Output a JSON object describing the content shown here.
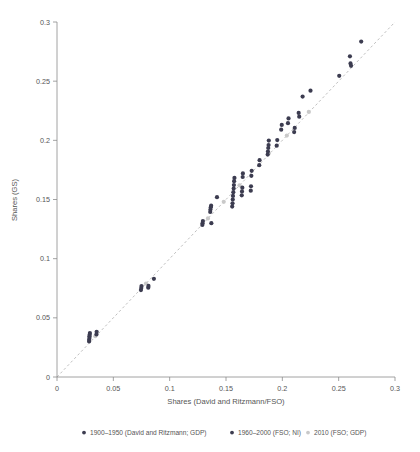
{
  "chart_data": {
    "type": "scatter",
    "title": "",
    "xlabel": "Shares (David and Ritzmann/FSO)",
    "ylabel": "Shares (GS)",
    "xlim": [
      0,
      0.3
    ],
    "ylim": [
      0,
      0.3
    ],
    "xticks": [
      "0",
      "0.05",
      "0.1",
      "0.15",
      "0.2",
      "0.25",
      "0.3"
    ],
    "xtick_values": [
      0,
      0.05,
      0.1,
      0.15,
      0.2,
      0.25,
      0.3
    ],
    "yticks": [
      "0",
      "0.05",
      "0.1",
      "0.15",
      "0.2",
      "0.25",
      "0.3"
    ],
    "ytick_values": [
      0,
      0.05,
      0.1,
      0.15,
      0.2,
      0.25,
      0.3
    ],
    "grid": false,
    "legend_position": "bottom",
    "reference_line": {
      "name": "45-degree identity line",
      "style": "dashed",
      "color": "#b8b8b8",
      "from": [
        0,
        0
      ],
      "to": [
        0.3,
        0.3
      ]
    },
    "series": [
      {
        "name": "1900–1950 (David and Ritzmann; GDP)",
        "color": "#3c3c50",
        "marker": "circle",
        "points": [
          [
            0.0285,
            0.03
          ],
          [
            0.0285,
            0.0315
          ],
          [
            0.0288,
            0.033
          ],
          [
            0.0288,
            0.0345
          ],
          [
            0.029,
            0.0358
          ],
          [
            0.0292,
            0.0372
          ],
          [
            0.035,
            0.036
          ],
          [
            0.0352,
            0.0382
          ],
          [
            0.0745,
            0.0735
          ],
          [
            0.0748,
            0.0752
          ],
          [
            0.075,
            0.0768
          ],
          [
            0.081,
            0.0755
          ],
          [
            0.0812,
            0.077
          ],
          [
            0.086,
            0.083
          ],
          [
            0.129,
            0.1285
          ],
          [
            0.1292,
            0.13
          ],
          [
            0.1295,
            0.1318
          ],
          [
            0.136,
            0.1395
          ],
          [
            0.1362,
            0.1415
          ],
          [
            0.1365,
            0.1435
          ],
          [
            0.1368,
            0.1448
          ],
          [
            0.137,
            0.13
          ],
          [
            0.142,
            0.152
          ]
        ]
      },
      {
        "name": "1960–2000 (FSO; NI)",
        "color": "#3c3c50",
        "marker": "circle",
        "points": [
          [
            0.1555,
            0.144
          ],
          [
            0.1558,
            0.1468
          ],
          [
            0.156,
            0.15
          ],
          [
            0.1562,
            0.153
          ],
          [
            0.1565,
            0.1562
          ],
          [
            0.1568,
            0.1592
          ],
          [
            0.157,
            0.1622
          ],
          [
            0.1572,
            0.1655
          ],
          [
            0.1575,
            0.1682
          ],
          [
            0.164,
            0.1535
          ],
          [
            0.1642,
            0.1568
          ],
          [
            0.1645,
            0.16
          ],
          [
            0.1648,
            0.169
          ],
          [
            0.165,
            0.172
          ],
          [
            0.172,
            0.1575
          ],
          [
            0.1722,
            0.1612
          ],
          [
            0.1725,
            0.17
          ],
          [
            0.1728,
            0.1742
          ],
          [
            0.1795,
            0.179
          ],
          [
            0.1798,
            0.1832
          ],
          [
            0.187,
            0.188
          ],
          [
            0.1872,
            0.1905
          ],
          [
            0.1875,
            0.1935
          ],
          [
            0.1878,
            0.196
          ],
          [
            0.188,
            0.1998
          ],
          [
            0.195,
            0.1955
          ],
          [
            0.1955,
            0.2002
          ],
          [
            0.199,
            0.209
          ],
          [
            0.1995,
            0.213
          ],
          [
            0.205,
            0.2145
          ],
          [
            0.2055,
            0.2185
          ],
          [
            0.2105,
            0.207
          ],
          [
            0.211,
            0.2105
          ],
          [
            0.2145,
            0.2232
          ],
          [
            0.215,
            0.22
          ],
          [
            0.218,
            0.237
          ],
          [
            0.225,
            0.242
          ],
          [
            0.2505,
            0.2545
          ],
          [
            0.26,
            0.271
          ],
          [
            0.2605,
            0.265
          ],
          [
            0.261,
            0.263
          ],
          [
            0.27,
            0.2835
          ]
        ]
      },
      {
        "name": "2010 (FSO; GDP)",
        "color": "#c9c9c9",
        "marker": "circle",
        "points": [
          [
            0.034,
            0.0345
          ],
          [
            0.079,
            0.079
          ],
          [
            0.134,
            0.134
          ],
          [
            0.148,
            0.148
          ],
          [
            0.162,
            0.162
          ],
          [
            0.188,
            0.189
          ],
          [
            0.204,
            0.204
          ],
          [
            0.2235,
            0.224
          ]
        ]
      }
    ]
  },
  "plot_geometry": {
    "left": 57,
    "right": 395,
    "top": 22,
    "bottom": 377
  },
  "legend": {
    "items": [
      {
        "label": "1900–1950 (David and Ritzmann; GDP)",
        "color": "#3c3c50",
        "x": 84
      },
      {
        "label": "1960–2000 (FSO; NI)",
        "color": "#3c3c50",
        "x": 232
      },
      {
        "label": "2010 (FSO; GDP)",
        "color": "#c9c9c9",
        "x": 308
      }
    ],
    "y": 435
  }
}
